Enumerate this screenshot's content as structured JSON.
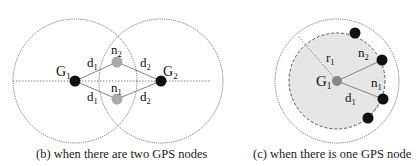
{
  "panel_b": {
    "caption": "(b) when there are two GPS nodes",
    "nodes": {
      "G1": {
        "label": "G",
        "sub": "1"
      },
      "G2": {
        "label": "G",
        "sub": "2"
      },
      "n1": {
        "label": "n",
        "sub": "1"
      },
      "n2": {
        "label": "n",
        "sub": "2"
      }
    },
    "edges": {
      "G1_n2": {
        "label": "d",
        "sub": "1"
      },
      "G1_n1": {
        "label": "d",
        "sub": "1"
      },
      "G2_n2": {
        "label": "d",
        "sub": "2"
      },
      "G2_n1": {
        "label": "d",
        "sub": "2"
      }
    }
  },
  "panel_c": {
    "caption": "(c) when there is one GPS node",
    "nodes": {
      "G1": {
        "label": "G",
        "sub": "1"
      },
      "n1": {
        "label": "n",
        "sub": "1"
      },
      "n2": {
        "label": "n",
        "sub": "2"
      }
    },
    "radius": {
      "label": "r",
      "sub": "1"
    },
    "edge": {
      "label": "d",
      "sub": "1"
    }
  },
  "colors": {
    "gps_node": "#111111",
    "unknown_node": "#aaaaaa",
    "shaded_disk": "#e6e6e6",
    "line": "#555555"
  }
}
